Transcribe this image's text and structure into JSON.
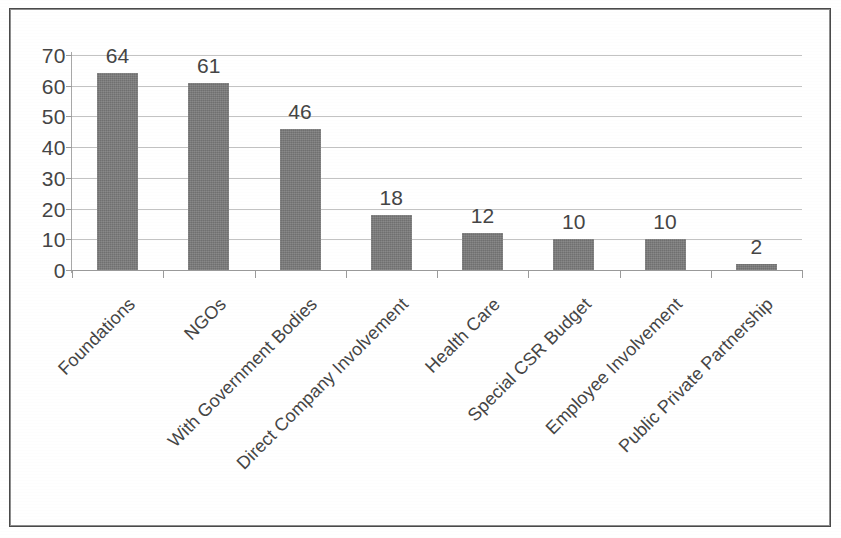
{
  "chart_data": {
    "type": "bar",
    "title": "",
    "subtitle": "",
    "xlabel": "",
    "ylabel": "",
    "categories": [
      "Foundations",
      "NGOs",
      "With Government Bodies",
      "Direct Company Involvement",
      "Health Care",
      "Special CSR Budget",
      "Employee Involvement",
      "Public Private Partnership"
    ],
    "values": [
      64,
      61,
      46,
      18,
      12,
      10,
      10,
      2
    ],
    "value_labels": [
      "64",
      "61",
      "46",
      "18",
      "12",
      "10",
      "10",
      "2"
    ],
    "ylim": [
      0,
      70
    ],
    "ytick_values": [
      0,
      10,
      20,
      30,
      40,
      50,
      60,
      70
    ],
    "ytick_labels": [
      "0",
      "10",
      "20",
      "30",
      "40",
      "50",
      "60",
      "70"
    ],
    "grid": true,
    "grid_axis": "y",
    "legend": false,
    "legend_position": "none",
    "bar_color": "#7b7b7b",
    "gridline_color": "#b9b9b9",
    "axis_color": "#9a9a9a",
    "text_color": "#454545",
    "category_label_rotation": -45,
    "background_color": "#ffffff",
    "border_color": "#4a4a4a"
  }
}
